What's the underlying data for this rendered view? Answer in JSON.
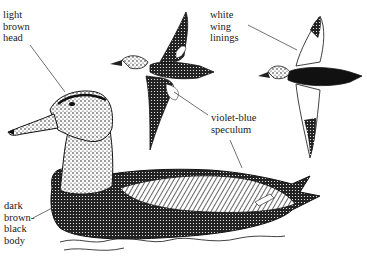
{
  "figure": {
    "labels": {
      "head": "light\nbrown\nhead",
      "wing_linings": "white\nwing\nlinings",
      "speculum": "violet-blue\nspeculum",
      "body": "dark\nbrown-\nblack\nbody"
    },
    "colors": {
      "ink": "#1a1a1a",
      "paper": "#ffffff"
    }
  }
}
